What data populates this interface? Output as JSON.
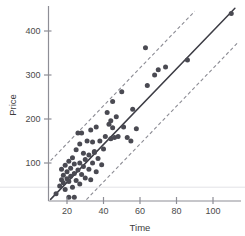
{
  "chart_data": {
    "type": "scatter",
    "title": "",
    "xlabel": "Time",
    "ylabel": "Price",
    "xlim": [
      10,
      115
    ],
    "ylim": [
      0,
      460
    ],
    "xticks": [
      20,
      40,
      60,
      80,
      100
    ],
    "yticks": [
      100,
      200,
      300,
      400
    ],
    "xtick_labels": [
      "20",
      "40",
      "60",
      "80",
      "100"
    ],
    "ytick_labels": [
      "100",
      "200",
      "300",
      "400"
    ],
    "grid": false,
    "legend": null,
    "marker_color": "#4a4a52",
    "line_color": "#3d3d45",
    "band_color": "#8c8c94",
    "axis_color": "#8e8e96",
    "fit_line": {
      "label": "regression line",
      "style": "solid",
      "slope": 4.3,
      "intercept": -30,
      "x_start": 11,
      "x_end": 112
    },
    "prediction_bands": [
      {
        "label": "upper prediction band",
        "style": "dashed",
        "slope": 4.3,
        "intercept": 58,
        "x_start": 11,
        "x_end": 90
      },
      {
        "label": "lower prediction band",
        "style": "dashed",
        "slope": 4.3,
        "intercept": -115,
        "x_start": 26,
        "x_end": 114
      }
    ],
    "points": [
      {
        "x": 14,
        "y": 30
      },
      {
        "x": 16,
        "y": 48
      },
      {
        "x": 17,
        "y": 62
      },
      {
        "x": 17,
        "y": 86
      },
      {
        "x": 18,
        "y": 55
      },
      {
        "x": 18,
        "y": 72
      },
      {
        "x": 19,
        "y": 40
      },
      {
        "x": 19,
        "y": 95
      },
      {
        "x": 20,
        "y": 64
      },
      {
        "x": 20,
        "y": 80
      },
      {
        "x": 21,
        "y": 22
      },
      {
        "x": 21,
        "y": 58
      },
      {
        "x": 21,
        "y": 104
      },
      {
        "x": 22,
        "y": 70
      },
      {
        "x": 22,
        "y": 88
      },
      {
        "x": 23,
        "y": 45
      },
      {
        "x": 23,
        "y": 112
      },
      {
        "x": 24,
        "y": 22
      },
      {
        "x": 24,
        "y": 76
      },
      {
        "x": 24,
        "y": 98
      },
      {
        "x": 25,
        "y": 60
      },
      {
        "x": 25,
        "y": 130
      },
      {
        "x": 26,
        "y": 84
      },
      {
        "x": 26,
        "y": 168
      },
      {
        "x": 27,
        "y": 52
      },
      {
        "x": 27,
        "y": 100
      },
      {
        "x": 27,
        "y": 143
      },
      {
        "x": 28,
        "y": 74
      },
      {
        "x": 28,
        "y": 168
      },
      {
        "x": 29,
        "y": 92
      },
      {
        "x": 29,
        "y": 122
      },
      {
        "x": 30,
        "y": 66
      },
      {
        "x": 30,
        "y": 108
      },
      {
        "x": 31,
        "y": 150
      },
      {
        "x": 32,
        "y": 86
      },
      {
        "x": 32,
        "y": 118
      },
      {
        "x": 33,
        "y": 62
      },
      {
        "x": 33,
        "y": 175
      },
      {
        "x": 34,
        "y": 100
      },
      {
        "x": 34,
        "y": 148
      },
      {
        "x": 35,
        "y": 124
      },
      {
        "x": 35,
        "y": 126
      },
      {
        "x": 36,
        "y": 80
      },
      {
        "x": 36,
        "y": 182
      },
      {
        "x": 37,
        "y": 110
      },
      {
        "x": 38,
        "y": 150
      },
      {
        "x": 39,
        "y": 96
      },
      {
        "x": 40,
        "y": 132
      },
      {
        "x": 41,
        "y": 160
      },
      {
        "x": 42,
        "y": 215
      },
      {
        "x": 43,
        "y": 188
      },
      {
        "x": 44,
        "y": 155
      },
      {
        "x": 44,
        "y": 196
      },
      {
        "x": 45,
        "y": 180
      },
      {
        "x": 45,
        "y": 240
      },
      {
        "x": 46,
        "y": 158
      },
      {
        "x": 47,
        "y": 205
      },
      {
        "x": 48,
        "y": 160
      },
      {
        "x": 50,
        "y": 262
      },
      {
        "x": 51,
        "y": 182
      },
      {
        "x": 53,
        "y": 158
      },
      {
        "x": 55,
        "y": 150
      },
      {
        "x": 56,
        "y": 222
      },
      {
        "x": 58,
        "y": 178
      },
      {
        "x": 63,
        "y": 362
      },
      {
        "x": 64,
        "y": 276
      },
      {
        "x": 68,
        "y": 300
      },
      {
        "x": 70,
        "y": 312
      },
      {
        "x": 74,
        "y": 318
      },
      {
        "x": 86,
        "y": 334
      },
      {
        "x": 110,
        "y": 440
      }
    ],
    "n_points": 71,
    "baseline_rule": {
      "label": "faint-horizontal-rule",
      "y": 45
    }
  }
}
